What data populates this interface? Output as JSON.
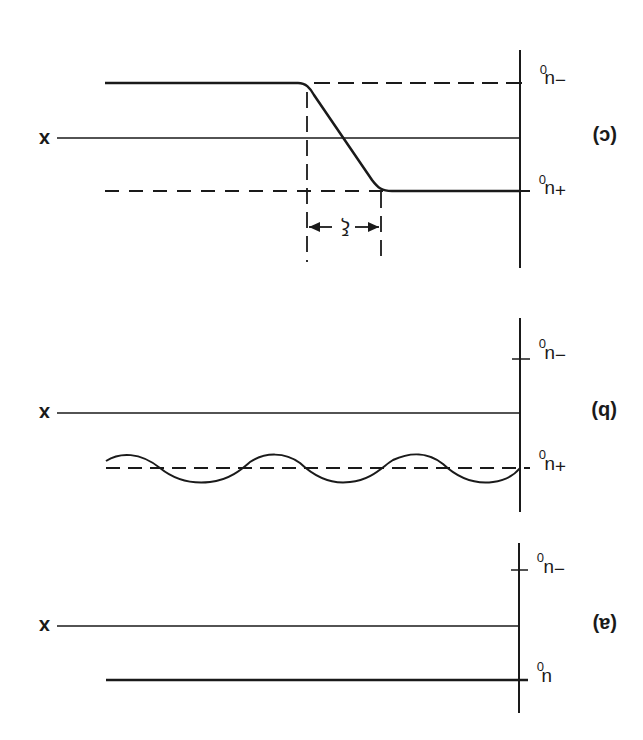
{
  "figure": {
    "orientation": "rotated 180 degrees",
    "panels": [
      {
        "id": "c",
        "label": "(c)",
        "axis_label": "x",
        "upper_level_label": "−u",
        "upper_level_sub": "0",
        "lower_level_label": "+u",
        "lower_level_sub": "0",
        "width_label": "ξ",
        "description": "transition from one level to the other over width ξ"
      },
      {
        "id": "b",
        "label": "(b)",
        "axis_label": "x",
        "upper_level_label": "−u",
        "upper_level_sub": "0",
        "lower_level_label": "+u",
        "lower_level_sub": "0",
        "description": "oscillation about a level"
      },
      {
        "id": "a",
        "label": "(a)",
        "axis_label": "x",
        "upper_level_label": "−u",
        "upper_level_sub": "0",
        "lower_level_label": "u",
        "lower_level_sub": "0",
        "description": "uniform level"
      }
    ],
    "colors": {
      "ink": "#1a1a1a",
      "background": "#ffffff"
    }
  }
}
